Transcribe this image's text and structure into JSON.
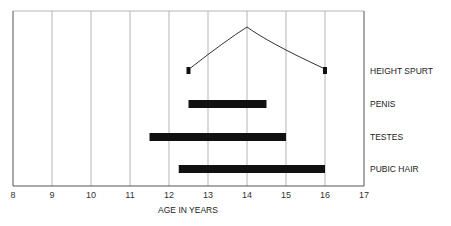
{
  "chart_data": {
    "type": "bar",
    "subtype": "horizontal-range (gantt-style)",
    "title": "",
    "xlabel": "AGE IN YEARS",
    "ylabel": "",
    "xlim": [
      8,
      17
    ],
    "x_ticks": [
      "8",
      "9",
      "10",
      "11",
      "12",
      "13",
      "14",
      "15",
      "16",
      "17"
    ],
    "grid": {
      "vertical": true,
      "horizontal": false
    },
    "categories": [
      "HEIGHT SPURT",
      "PENIS",
      "TESTES",
      "PUBIC HAIR"
    ],
    "series": [
      {
        "name": "HEIGHT SPURT",
        "start": 12.5,
        "end": 16.0,
        "peak": 14.0,
        "shape": "peaked-curve"
      },
      {
        "name": "PENIS",
        "start": 12.5,
        "end": 14.5
      },
      {
        "name": "TESTES",
        "start": 11.5,
        "end": 15.0
      },
      {
        "name": "PUBIC HAIR",
        "start": 12.25,
        "end": 16.0
      }
    ],
    "legend": "none; category labels at right of plot"
  },
  "colors": {
    "bar": "#111111",
    "grid": "#b5b5b5",
    "axis": "#555555"
  }
}
